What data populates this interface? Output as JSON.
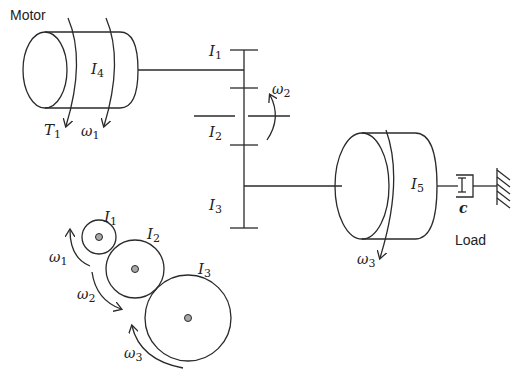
{
  "diagram": {
    "labels": {
      "motor": "Motor",
      "load": "Load",
      "motor_inertia": {
        "sym": "I",
        "sub": "4"
      },
      "load_inertia": {
        "sym": "I",
        "sub": "5"
      },
      "torque": {
        "sym": "T",
        "sub": "1"
      },
      "omega1_motor": {
        "sym": "ω",
        "sub": "1"
      },
      "gear1": {
        "sym": "I",
        "sub": "1"
      },
      "gear2": {
        "sym": "I",
        "sub": "2"
      },
      "gear3": {
        "sym": "I",
        "sub": "3"
      },
      "omega2_shaft": {
        "sym": "ω",
        "sub": "2"
      },
      "omega3_load": {
        "sym": "ω",
        "sub": "3"
      },
      "damper": "c",
      "gear1_small": {
        "sym": "I",
        "sub": "1"
      },
      "gear2_small": {
        "sym": "I",
        "sub": "2"
      },
      "gear3_small": {
        "sym": "I",
        "sub": "3"
      },
      "omega1_gear": {
        "sym": "ω",
        "sub": "1"
      },
      "omega2_gear": {
        "sym": "ω",
        "sub": "2"
      },
      "omega3_gear": {
        "sym": "ω",
        "sub": "3"
      }
    },
    "colors": {
      "line": "#2a2a2a",
      "hub": "#a8a8a8",
      "background": "#ffffff"
    }
  }
}
